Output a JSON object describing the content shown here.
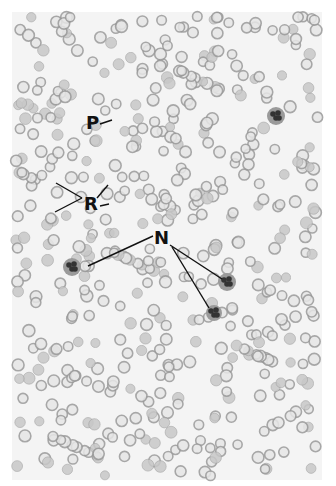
{
  "figure": {
    "labels": [
      {
        "id": "P",
        "text": "P",
        "x": 86,
        "y": 114
      },
      {
        "id": "R",
        "text": "R",
        "x": 84,
        "y": 195
      },
      {
        "id": "N",
        "text": "N",
        "x": 154,
        "y": 229
      }
    ],
    "leader_lines": [
      {
        "label": "P",
        "x1": 100,
        "y1": 124,
        "x2": 112,
        "y2": 120
      },
      {
        "label": "R",
        "x1": 82,
        "y1": 198,
        "x2": 56,
        "y2": 183
      },
      {
        "label": "R",
        "x1": 82,
        "y1": 198,
        "x2": 55,
        "y2": 212
      },
      {
        "label": "R",
        "x1": 97,
        "y1": 198,
        "x2": 108,
        "y2": 185
      },
      {
        "label": "R",
        "x1": 100,
        "y1": 206,
        "x2": 109,
        "y2": 204
      },
      {
        "label": "N",
        "x1": 153,
        "y1": 236,
        "x2": 88,
        "y2": 266
      },
      {
        "label": "N",
        "x1": 170,
        "y1": 245,
        "x2": 222,
        "y2": 279
      },
      {
        "label": "N",
        "x1": 172,
        "y1": 247,
        "x2": 209,
        "y2": 308
      }
    ],
    "neutrophils": [
      {
        "x": 72,
        "y": 267,
        "r": 9
      },
      {
        "x": 227,
        "y": 282,
        "r": 9
      },
      {
        "x": 214,
        "y": 313,
        "r": 8
      },
      {
        "x": 276,
        "y": 116,
        "r": 9
      }
    ],
    "colors": {
      "background": "#f4f4f4",
      "rbc_ring": "#9a9a9a",
      "rbc_fill": "#c8c8c8",
      "neutrophil": "#333333",
      "label": "#111111"
    }
  }
}
